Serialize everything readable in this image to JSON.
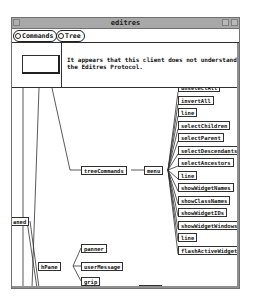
{
  "window": {
    "title": "editres"
  },
  "menubar": {
    "commands_label": "Commands",
    "tree_label": "Tree"
  },
  "message": {
    "text": "It appears that this client does not understand the Editres Protocol."
  },
  "tree": {
    "root_partial": "aned",
    "tree_commands": "treeCommands",
    "menu": "menu",
    "menu_items": [
      "unselectAll",
      "invertAll",
      "line",
      "selectChildren",
      "selectParent",
      "selectDescendants",
      "selectAncestors",
      "line",
      "showWidgetNames",
      "showClassNames",
      "showWidgetIDs",
      "showWidgetWindows",
      "line",
      "flashActiveWidgets"
    ],
    "hpane": "hPane",
    "hpane_children": [
      "panner",
      "userMessage",
      "grip"
    ],
    "bottom_partial": "porth"
  }
}
